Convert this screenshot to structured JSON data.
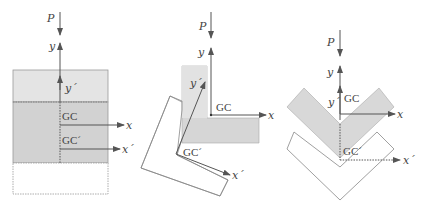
{
  "figure": {
    "panels": [
      {
        "id": "rectangular-section",
        "labels": {
          "load": "P",
          "y": "y",
          "y_prime": "y´",
          "gc": "GC",
          "gc_prime": "GC´",
          "x": "x",
          "x_prime": "x´"
        }
      },
      {
        "id": "angle-section",
        "labels": {
          "load": "P",
          "y": "y",
          "y_prime": "y´",
          "gc": "GC",
          "gc_prime": "GC´",
          "x": "x",
          "x_prime": "x´"
        }
      },
      {
        "id": "v-section",
        "labels": {
          "load": "P",
          "y": "y",
          "y_prime": "y´",
          "gc": "GC",
          "gc_prime": "GC´",
          "x": "x",
          "x_prime": "x´"
        }
      }
    ],
    "colors": {
      "shade_light": "#e2e2e2",
      "shade_dark": "#cfcfcf",
      "line": "#555555",
      "outline": "#8a8a8a"
    }
  }
}
